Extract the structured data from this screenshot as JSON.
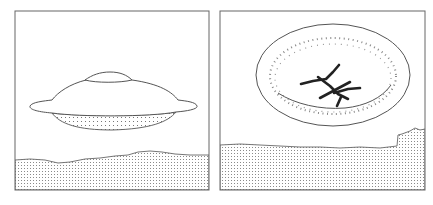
{
  "figure": {
    "panels": [
      {
        "id": "left",
        "subject": "flying-saucer-over-ground",
        "frame": {
          "x": 15,
          "y": 11,
          "w": 194,
          "h": 179
        }
      },
      {
        "id": "right",
        "subject": "elliptical-landing-trace-with-crossed-marks",
        "frame": {
          "x": 220,
          "y": 11,
          "w": 205,
          "h": 179
        }
      }
    ],
    "colors": {
      "line": "#555555",
      "mark": "#222222",
      "stipple": "#8a8a8a",
      "background": "#ffffff"
    }
  }
}
